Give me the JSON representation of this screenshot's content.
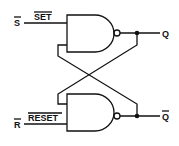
{
  "inputs": {
    "top": {
      "symbol": "S",
      "name": "SET",
      "inverted": true
    },
    "bottom": {
      "symbol": "R",
      "name": "RESET",
      "inverted": true
    }
  },
  "outputs": {
    "top": {
      "symbol": "Q",
      "inverted": false
    },
    "bottom": {
      "symbol": "Q",
      "inverted": true
    }
  },
  "gates": [
    {
      "type": "NAND",
      "position": "top"
    },
    {
      "type": "NAND",
      "position": "bottom"
    }
  ],
  "colors": {
    "line": "#111111",
    "background": "#ffffff"
  }
}
